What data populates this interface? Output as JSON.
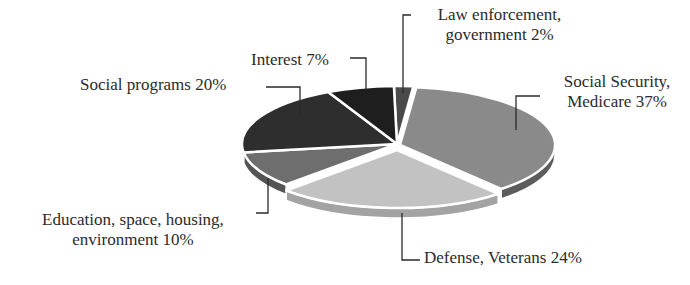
{
  "chart_data": {
    "type": "pie",
    "style": "3d-exploded",
    "title": "",
    "categories": [
      "Law enforcement, government",
      "Social Security, Medicare",
      "Defense, Veterans",
      "Education, space, housing, environment",
      "Social programs",
      "Interest"
    ],
    "values": [
      2,
      37,
      24,
      10,
      20,
      7
    ],
    "unit": "%",
    "colors": [
      "#4a4a4a",
      "#8a8a8a",
      "#c2c2c2",
      "#6e6e6e",
      "#2e2e2e",
      "#1e1e1e"
    ],
    "side_colors": [
      "#3a3a3a",
      "#5c5c5c",
      "#a3a3a3",
      "#555555",
      "#222222",
      "#151515"
    ],
    "legend": "none (callout labels)"
  },
  "labels": {
    "law": [
      "Law enforcement,",
      "government 2%"
    ],
    "social_security": [
      "Social Security,",
      "Medicare 37%"
    ],
    "defense": [
      "Defense, Veterans 24%"
    ],
    "education": [
      "Education, space, housing,",
      "environment 10%"
    ],
    "social_programs": [
      "Social programs 20%"
    ],
    "interest": [
      "Interest 7%"
    ]
  }
}
